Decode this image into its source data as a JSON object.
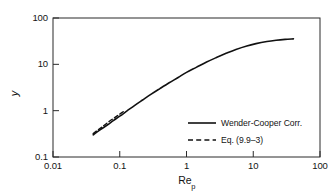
{
  "chart_data": {
    "type": "line",
    "title": "",
    "subtitle": "",
    "xlabel": "Re_p",
    "xlabel_base": "Re",
    "xlabel_sub": "p",
    "ylabel": "y",
    "xscale": "log",
    "yscale": "log",
    "xlim": [
      0.01,
      100
    ],
    "ylim": [
      0.1,
      100
    ],
    "grid": false,
    "legend_position": "lower-right-inside",
    "xticks": [
      0.01,
      0.1,
      1,
      10,
      100
    ],
    "xtick_labels": [
      "0.01",
      "0.1",
      "1",
      "10",
      "100"
    ],
    "yticks": [
      0.1,
      1,
      10,
      100
    ],
    "ytick_labels": [
      "0.1",
      "1",
      "10",
      "100"
    ],
    "series": [
      {
        "name": "Wender-Cooper Corr.",
        "style": "solid",
        "color": "#111111",
        "x": [
          0.04,
          0.05,
          0.065,
          0.08,
          0.1,
          0.13,
          0.17,
          0.22,
          0.3,
          0.4,
          0.55,
          0.75,
          1.0,
          1.4,
          2.0,
          2.8,
          4.0,
          5.5,
          8.0,
          11.0,
          16.0,
          22.0,
          30.0,
          40.0
        ],
        "y": [
          0.3,
          0.38,
          0.49,
          0.61,
          0.76,
          1.0,
          1.32,
          1.7,
          2.3,
          3.0,
          4.0,
          5.2,
          6.7,
          8.6,
          11.2,
          14.0,
          17.5,
          21.0,
          25.0,
          28.0,
          31.0,
          33.0,
          34.5,
          35.5
        ]
      },
      {
        "name": "Eq. (9.9–3)",
        "style": "dashed",
        "color": "#111111",
        "x": [
          0.04,
          0.048,
          0.058,
          0.07,
          0.085,
          0.1,
          0.12
        ],
        "y": [
          0.32,
          0.39,
          0.48,
          0.59,
          0.715,
          0.84,
          1.01
        ]
      }
    ]
  },
  "legend": {
    "entries": [
      {
        "label": "Wender-Cooper Corr.",
        "style": "solid"
      },
      {
        "label": "Eq. (9.9–3)",
        "style": "dashed"
      }
    ]
  },
  "axes": {
    "x_title_base": "Re",
    "x_title_sub": "p",
    "y_title": "y",
    "x_tick_labels": [
      "0.01",
      "0.1",
      "1",
      "10",
      "100"
    ],
    "y_tick_labels": [
      "100",
      "10",
      "1",
      "0.1"
    ]
  },
  "colors": {
    "line": "#111111",
    "frame": "#2b2b2b",
    "background": "#ffffff",
    "text": "#141414"
  }
}
